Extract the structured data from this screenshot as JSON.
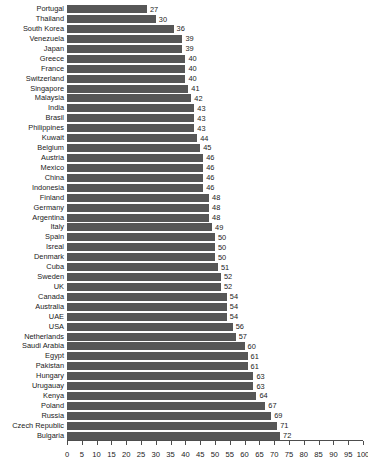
{
  "chart_data": {
    "type": "bar",
    "orientation": "horizontal",
    "title": "",
    "subtitle": "",
    "xlabel": "",
    "ylabel": "",
    "xlim": [
      0,
      100
    ],
    "ylim": null,
    "grid": false,
    "legend": null,
    "bar_color": "#575757",
    "axis_color": "#4d4d4d",
    "background_color": "#ffffff",
    "xticks": [
      0,
      5,
      10,
      15,
      20,
      25,
      30,
      35,
      40,
      45,
      50,
      55,
      60,
      65,
      70,
      75,
      80,
      85,
      90,
      95,
      100
    ],
    "xtick_labels": [
      "0",
      "5",
      "10",
      "15",
      "20",
      "25",
      "30",
      "35",
      "40",
      "45",
      "50",
      "55",
      "60",
      "65",
      "70",
      "75",
      "80",
      "85",
      "90",
      "95",
      "100"
    ],
    "value_labels_shown": true,
    "categories": [
      "Portugal",
      "Thailand",
      "South Korea",
      "Venezuela",
      "Japan",
      "Greece",
      "France",
      "Switzerland",
      "Singapore",
      "Malaysia",
      "India",
      "Brasil",
      "Philippines",
      "Kuwait",
      "Belgium",
      "Austria",
      "Mexico",
      "China",
      "Indonesia",
      "Finland",
      "Germany",
      "Argentina",
      "Italy",
      "Spain",
      "Isreal",
      "Denmark",
      "Cuba",
      "Sweden",
      "UK",
      "Canada",
      "Australia",
      "UAE",
      "USA",
      "Netherlands",
      "Saudi Arabia",
      "Egypt",
      "Pakistan",
      "Hungary",
      "Urugauay",
      "Kenya",
      "Poland",
      "Russia",
      "Czech Republic",
      "Bulgaria"
    ],
    "values": [
      27,
      30,
      36,
      39,
      39,
      40,
      40,
      40,
      41,
      42,
      43,
      43,
      43,
      44,
      45,
      46,
      46,
      46,
      46,
      48,
      48,
      48,
      49,
      50,
      50,
      50,
      51,
      52,
      52,
      54,
      54,
      54,
      56,
      57,
      60,
      61,
      61,
      63,
      63,
      64,
      67,
      69,
      71,
      72
    ]
  }
}
